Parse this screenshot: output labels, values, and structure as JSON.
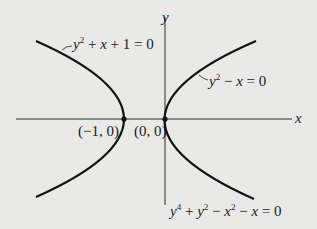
{
  "diagram": {
    "type": "graph-of-curves",
    "axes": {
      "x_label": "x",
      "y_label": "y",
      "origin_px": [
        165,
        119
      ],
      "unit_px": 41
    },
    "curves": [
      {
        "name": "left-parabola",
        "equation": "y² + x + 1 = 0",
        "label_html": "y<sup>2</sup> + x + 1 = 0",
        "vertex": [
          -1,
          0
        ]
      },
      {
        "name": "right-parabola",
        "equation": "y² − x = 0",
        "label_html": "y<sup>2</sup> − x = 0",
        "vertex": [
          0,
          0
        ]
      }
    ],
    "combined_equation": "y⁴ + y² − x² − x = 0",
    "points": [
      {
        "label": "(−1, 0)",
        "coords": [
          -1,
          0
        ]
      },
      {
        "label": "(0, 0)",
        "coords": [
          0,
          0
        ]
      }
    ],
    "colors": {
      "background": "#e9e9e7",
      "ink": "#1a1a1a"
    }
  },
  "labels": {
    "x_axis": "x",
    "y_axis": "y",
    "left_curve": "y² + x + 1 = 0",
    "right_curve": "y² − x = 0",
    "combined": "y⁴ + y² − x² − x = 0",
    "point_left": "(−1, 0)",
    "point_origin": "(0, 0)"
  }
}
